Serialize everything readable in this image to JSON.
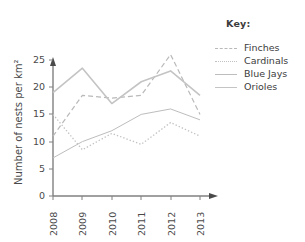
{
  "chart_data": {
    "type": "line",
    "title": "",
    "xlabel": "",
    "ylabel": "Number of nests per km²",
    "categories": [
      "2008",
      "2009",
      "2010",
      "2011",
      "2012",
      "2013"
    ],
    "x": [
      2008,
      2009,
      2010,
      2011,
      2012,
      2013
    ],
    "ylim": [
      0,
      25
    ],
    "yticks": [
      0,
      5,
      10,
      15,
      20,
      25
    ],
    "grid": false,
    "legend_position": "right",
    "legend_title": "Key:",
    "series": [
      {
        "name": "Finches",
        "style": "dashed",
        "color": "#b9b9b9",
        "values": [
          11,
          18.5,
          18,
          18.5,
          26,
          15
        ]
      },
      {
        "name": "Cardinals",
        "style": "dotted",
        "color": "#c2c2c2",
        "values": [
          15,
          8.5,
          11.5,
          9.5,
          13.5,
          11
        ]
      },
      {
        "name": "Blue Jays",
        "style": "solid",
        "color": "#bdbdbd",
        "values": [
          7,
          10,
          12,
          15,
          16,
          14
        ]
      },
      {
        "name": "Orioles",
        "style": "solid",
        "color": "#c4c4c4",
        "values": [
          19,
          23.5,
          17,
          21,
          23,
          18.5
        ]
      }
    ]
  },
  "axes": {
    "y_tick_labels": [
      "25",
      "20",
      "15",
      "10",
      "5",
      "0"
    ],
    "y_axis_title": "Number of nests per km²",
    "x_tick_labels": [
      "2008",
      "2009",
      "2010",
      "2011",
      "2012",
      "2013"
    ]
  },
  "legend": {
    "title": "Key:",
    "items": [
      {
        "label": "Finches"
      },
      {
        "label": "Cardinals"
      },
      {
        "label": "Blue Jays"
      },
      {
        "label": "Orioles"
      }
    ]
  },
  "colors": {
    "axis": "#808080",
    "text": "#4a4a4a",
    "background": "#ffffff"
  }
}
